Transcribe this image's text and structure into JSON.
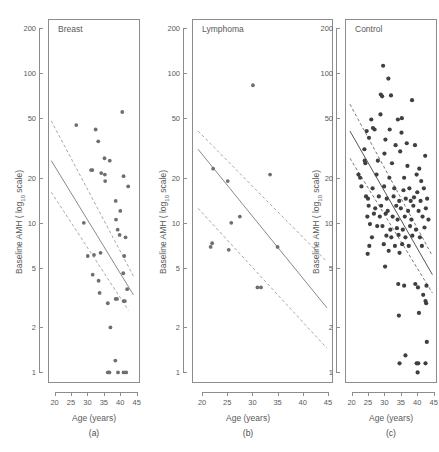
{
  "figure": {
    "panel_count": 3,
    "y_axis_label_main": "Baseline AMH ( log",
    "y_axis_label_sub": "10",
    "y_axis_label_tail": " scale)",
    "x_axis_label": "Age (years)"
  },
  "chart_data": [
    {
      "type": "scatter",
      "title": "Breast",
      "caption": "(a)",
      "xlabel": "Age (years)",
      "ylabel": "Baseline AMH ( log10 scale)",
      "xlim": [
        18,
        46
      ],
      "ylim": [
        0.85,
        230
      ],
      "yscale": "log10",
      "grid": false,
      "legend": "none",
      "yticks": [
        1,
        2,
        5,
        10,
        20,
        50,
        100,
        200
      ],
      "ytick_labels": [
        "1",
        "2",
        "5",
        "10",
        "20",
        "50",
        "100",
        "200"
      ],
      "xticks": [
        20,
        25,
        30,
        35,
        40,
        45
      ],
      "xtick_labels": [
        "20",
        "25",
        "30",
        "35",
        "40",
        "45"
      ],
      "points": [
        [
          26.6,
          45.0
        ],
        [
          32.5,
          42.0
        ],
        [
          33.3,
          35.0
        ],
        [
          40.6,
          55.0
        ],
        [
          35.2,
          27.0
        ],
        [
          36.8,
          26.0
        ],
        [
          31.1,
          22.5
        ],
        [
          31.5,
          22.5
        ],
        [
          35.3,
          21.0
        ],
        [
          41.0,
          20.5
        ],
        [
          35.4,
          19.0
        ],
        [
          42.4,
          17.5
        ],
        [
          34.2,
          21.5
        ],
        [
          38.6,
          14.0
        ],
        [
          40.0,
          12.0
        ],
        [
          28.9,
          10.0
        ],
        [
          38.7,
          10.5
        ],
        [
          39.2,
          9.0
        ],
        [
          39.8,
          8.3
        ],
        [
          41.6,
          8.0
        ],
        [
          30.1,
          6.0
        ],
        [
          32.0,
          6.1
        ],
        [
          34.0,
          6.3
        ],
        [
          41.2,
          6.0
        ],
        [
          31.6,
          4.5
        ],
        [
          40.9,
          4.6
        ],
        [
          33.4,
          4.1
        ],
        [
          42.1,
          3.6
        ],
        [
          33.7,
          3.4
        ],
        [
          38.6,
          3.1
        ],
        [
          39.0,
          3.1
        ],
        [
          41.0,
          3.0
        ],
        [
          41.4,
          3.0
        ],
        [
          36.2,
          2.9
        ],
        [
          37.0,
          2.0
        ],
        [
          38.5,
          1.2
        ],
        [
          36.2,
          1.0
        ],
        [
          36.7,
          1.0
        ],
        [
          39.3,
          1.0
        ],
        [
          41.0,
          1.0
        ],
        [
          41.8,
          1.0
        ]
      ],
      "fit_line": {
        "x": [
          19.0,
          44.0
        ],
        "y": [
          26.0,
          3.3
        ]
      },
      "ci_upper": {
        "x": [
          19.0,
          44.0
        ],
        "y": [
          48.0,
          4.4
        ]
      },
      "ci_lower": {
        "x": [
          19.0,
          42.5
        ],
        "y": [
          16.0,
          2.6
        ]
      }
    },
    {
      "type": "scatter",
      "title": "Lymphoma",
      "caption": "(b)",
      "xlabel": "Age (years)",
      "ylabel": "Baseline AMH ( log10 scale)",
      "xlim": [
        18,
        46
      ],
      "ylim": [
        0.85,
        230
      ],
      "yscale": "log10",
      "grid": false,
      "legend": "none",
      "yticks": [
        1,
        2,
        5,
        10,
        20,
        50,
        100,
        200
      ],
      "ytick_labels": [
        "1",
        "2",
        "5",
        "10",
        "20",
        "50",
        "100",
        "200"
      ],
      "xticks": [
        20,
        25,
        30,
        35,
        40,
        45
      ],
      "xtick_labels": [
        "20",
        "25",
        "30",
        "35",
        "40",
        "45"
      ],
      "points": [
        [
          30.1,
          83.0
        ],
        [
          22.2,
          23.0
        ],
        [
          33.5,
          21.0
        ],
        [
          25.1,
          19.0
        ],
        [
          27.5,
          11.0
        ],
        [
          25.8,
          10.0
        ],
        [
          22.0,
          7.3
        ],
        [
          21.7,
          6.9
        ],
        [
          25.3,
          6.6
        ],
        [
          35.0,
          6.9
        ],
        [
          31.0,
          3.7
        ],
        [
          31.7,
          3.7
        ]
      ],
      "fit_line": {
        "x": [
          19.2,
          44.8
        ],
        "y": [
          31.0,
          2.7
        ]
      },
      "ci_upper": {
        "x": [
          19.2,
          44.8
        ],
        "y": [
          41.0,
          5.5
        ]
      },
      "ci_lower": {
        "x": [
          19.2,
          44.8
        ],
        "y": [
          12.5,
          1.45
        ]
      }
    },
    {
      "type": "scatter",
      "title": "Control",
      "caption": "(c)",
      "xlabel": "Age (years)",
      "ylabel": "Baseline AMH ( log10 scale)",
      "xlim": [
        18,
        46
      ],
      "ylim": [
        0.85,
        230
      ],
      "yscale": "log10",
      "grid": false,
      "legend": "none",
      "yticks": [
        1,
        2,
        5,
        10,
        20,
        50,
        100,
        200
      ],
      "ytick_labels": [
        "1",
        "2",
        "5",
        "10",
        "20",
        "50",
        "100",
        "200"
      ],
      "xticks": [
        20,
        25,
        30,
        35,
        40,
        45
      ],
      "xtick_labels": [
        "20",
        "25",
        "30",
        "35",
        "40",
        "45"
      ],
      "points": [
        [
          29.6,
          112.0
        ],
        [
          31.2,
          92.0
        ],
        [
          28.9,
          72.0
        ],
        [
          29.3,
          70.0
        ],
        [
          32.0,
          71.0
        ],
        [
          38.4,
          66.0
        ],
        [
          28.8,
          53.0
        ],
        [
          26.0,
          49.0
        ],
        [
          34.1,
          49.0
        ],
        [
          35.3,
          50.0
        ],
        [
          26.5,
          43.0
        ],
        [
          27.0,
          42.0
        ],
        [
          24.6,
          41.0
        ],
        [
          31.6,
          42.0
        ],
        [
          35.2,
          40.0
        ],
        [
          25.3,
          37.0
        ],
        [
          30.3,
          36.0
        ],
        [
          33.4,
          33.0
        ],
        [
          36.8,
          34.0
        ],
        [
          39.3,
          33.0
        ],
        [
          23.9,
          31.0
        ],
        [
          30.0,
          29.0
        ],
        [
          34.8,
          30.0
        ],
        [
          42.4,
          28.0
        ],
        [
          24.0,
          26.0
        ],
        [
          24.2,
          25.0
        ],
        [
          28.0,
          26.0
        ],
        [
          32.3,
          25.0
        ],
        [
          37.0,
          24.0
        ],
        [
          40.6,
          23.0
        ],
        [
          22.1,
          21.0
        ],
        [
          22.6,
          20.0
        ],
        [
          27.6,
          21.0
        ],
        [
          31.5,
          20.0
        ],
        [
          36.0,
          20.0
        ],
        [
          39.8,
          21.0
        ],
        [
          41.2,
          19.0
        ],
        [
          23.0,
          17.5
        ],
        [
          26.4,
          17.0
        ],
        [
          29.9,
          17.5
        ],
        [
          33.0,
          17.0
        ],
        [
          35.8,
          16.5
        ],
        [
          37.6,
          17.0
        ],
        [
          40.0,
          16.0
        ],
        [
          42.0,
          17.0
        ],
        [
          24.4,
          15.0
        ],
        [
          25.0,
          14.5
        ],
        [
          28.3,
          15.0
        ],
        [
          30.7,
          14.5
        ],
        [
          32.8,
          15.0
        ],
        [
          34.5,
          14.0
        ],
        [
          36.5,
          14.5
        ],
        [
          38.0,
          14.0
        ],
        [
          39.0,
          14.8
        ],
        [
          41.0,
          14.0
        ],
        [
          43.0,
          14.5
        ],
        [
          25.2,
          13.0
        ],
        [
          27.2,
          12.5
        ],
        [
          29.0,
          13.0
        ],
        [
          31.0,
          12.0
        ],
        [
          33.6,
          13.0
        ],
        [
          35.0,
          12.5
        ],
        [
          37.2,
          12.0
        ],
        [
          38.8,
          13.0
        ],
        [
          40.4,
          12.0
        ],
        [
          42.6,
          12.5
        ],
        [
          24.8,
          11.0
        ],
        [
          26.8,
          11.5
        ],
        [
          28.6,
          11.0
        ],
        [
          30.4,
          11.5
        ],
        [
          32.5,
          11.0
        ],
        [
          34.0,
          10.5
        ],
        [
          36.2,
          11.0
        ],
        [
          38.2,
          10.5
        ],
        [
          41.6,
          11.0
        ],
        [
          43.4,
          10.5
        ],
        [
          25.6,
          9.8
        ],
        [
          27.8,
          9.5
        ],
        [
          29.4,
          9.5
        ],
        [
          31.8,
          9.0
        ],
        [
          33.8,
          9.2
        ],
        [
          35.6,
          9.0
        ],
        [
          37.8,
          9.5
        ],
        [
          39.6,
          9.0
        ],
        [
          42.2,
          9.3
        ],
        [
          26.2,
          8.0
        ],
        [
          30.6,
          8.2
        ],
        [
          32.1,
          8.0
        ],
        [
          34.3,
          8.3
        ],
        [
          36.4,
          8.0
        ],
        [
          38.5,
          8.2
        ],
        [
          40.8,
          8.0
        ],
        [
          25.4,
          7.0
        ],
        [
          29.8,
          7.2
        ],
        [
          33.2,
          7.0
        ],
        [
          35.4,
          7.2
        ],
        [
          37.4,
          7.0
        ],
        [
          41.4,
          7.0
        ],
        [
          24.9,
          6.2
        ],
        [
          31.3,
          6.5
        ],
        [
          34.6,
          6.3
        ],
        [
          30.2,
          5.1
        ],
        [
          34.2,
          3.9
        ],
        [
          36.0,
          3.8
        ],
        [
          39.4,
          3.9
        ],
        [
          40.2,
          3.7
        ],
        [
          42.8,
          3.8
        ],
        [
          41.8,
          3.3
        ],
        [
          42.5,
          3.0
        ],
        [
          42.7,
          2.9
        ],
        [
          40.5,
          2.5
        ],
        [
          34.4,
          2.4
        ],
        [
          42.9,
          1.6
        ],
        [
          36.4,
          1.3
        ],
        [
          34.6,
          1.15
        ],
        [
          39.8,
          1.15
        ],
        [
          40.3,
          1.15
        ],
        [
          42.5,
          1.15
        ],
        [
          40.1,
          1.0
        ]
      ],
      "fit_line": {
        "x": [
          19.5,
          44.6
        ],
        "y": [
          41.0,
          4.5
        ]
      },
      "ci_upper": {
        "x": [
          19.5,
          44.6
        ],
        "y": [
          62.0,
          6.0
        ]
      },
      "ci_lower": {
        "x": [
          19.5,
          44.6
        ],
        "y": [
          27.0,
          3.4
        ]
      }
    }
  ]
}
